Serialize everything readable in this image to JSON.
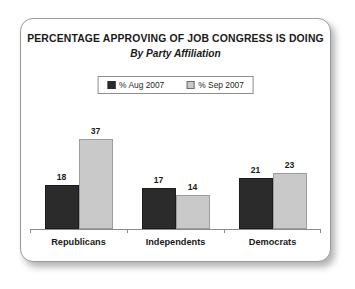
{
  "chart_data": {
    "type": "bar",
    "title": "PERCENTAGE APPROVING OF JOB CONGRESS IS DOING",
    "subtitle": "By Party Affiliation",
    "xlabel": "",
    "ylabel": "",
    "ylim": [
      0,
      40
    ],
    "grid": false,
    "legend_position": "top-center",
    "categories": [
      "Republicans",
      "Independents",
      "Democrats"
    ],
    "series": [
      {
        "name": "% Aug 2007",
        "color": "#2b2b2b",
        "values": [
          18,
          17,
          21
        ]
      },
      {
        "name": "% Sep 2007",
        "color": "#c9c9c9",
        "values": [
          37,
          14,
          23
        ]
      }
    ],
    "value_labels": {
      "Republicans": [
        "18",
        "37"
      ],
      "Independents": [
        "17",
        "14"
      ],
      "Democrats": [
        "21",
        "23"
      ]
    }
  },
  "legend": {
    "items": [
      {
        "label": "% Aug 2007",
        "swatch": "dark"
      },
      {
        "label": "% Sep 2007",
        "swatch": "light"
      }
    ]
  },
  "colors": {
    "series_dark": "#2b2b2b",
    "series_light": "#c9c9c9",
    "axis": "#8a8a8a",
    "frame": "#9a9a9a",
    "text": "#1a1a1a",
    "background": "#ffffff"
  }
}
